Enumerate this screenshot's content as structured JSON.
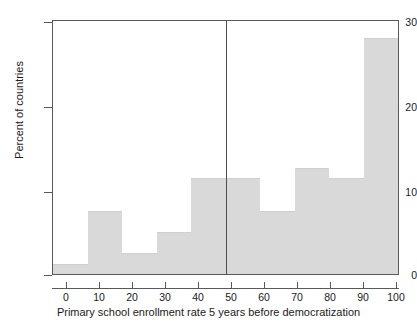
{
  "chart_data": {
    "type": "bar",
    "title": "",
    "subtitle": "",
    "xlabel": "Primary school enrollment rate 5 years before democratization",
    "ylabel": "Percent of countries",
    "categories": [
      "0-10",
      "10-20",
      "20-30",
      "30-40",
      "40-50",
      "50-60",
      "60-70",
      "70-80",
      "80-90",
      "90-100"
    ],
    "bin_edges": [
      0,
      10,
      20,
      30,
      40,
      50,
      60,
      70,
      80,
      90,
      100
    ],
    "values": [
      1.2,
      7.5,
      2.5,
      5.0,
      11.4,
      11.4,
      7.5,
      12.6,
      11.4,
      28.0
    ],
    "xlim": [
      0,
      100
    ],
    "ylim": [
      0,
      30
    ],
    "xticks": [
      0,
      10,
      20,
      30,
      40,
      50,
      60,
      70,
      80,
      90,
      100
    ],
    "xtick_labels": [
      "0",
      "10",
      "20",
      "30",
      "40",
      "50",
      "60",
      "70",
      "80",
      "90",
      "100"
    ],
    "yticks": [
      0,
      10,
      20,
      30
    ],
    "ytick_labels": [
      "0",
      "10",
      "20",
      "30"
    ],
    "grid": false,
    "legend": null,
    "annotations": [
      {
        "type": "vline",
        "x": 50,
        "label": ""
      }
    ],
    "bar_color": "#d9d9d9",
    "axis_color": "#595959",
    "reference_line_color": "#4d4d4d",
    "background": "#ffffff"
  }
}
